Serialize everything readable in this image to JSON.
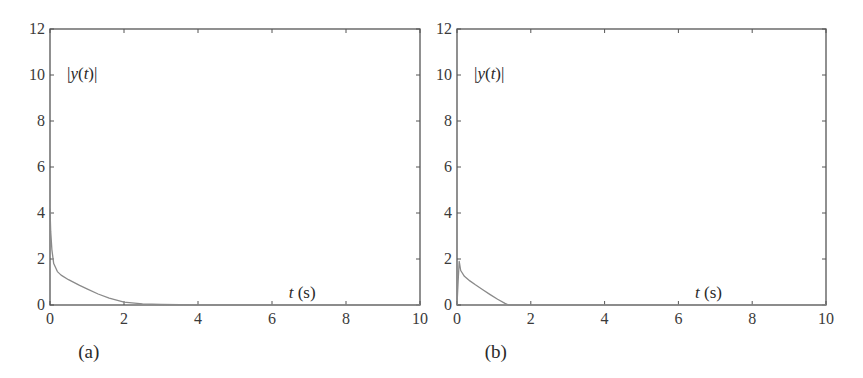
{
  "chart_data": [
    {
      "type": "line",
      "panel": "(a)",
      "caption": "(a)",
      "ylabel_annotation": "|y(t)|",
      "xlabel_annotation": "t (s)",
      "xlim": [
        0,
        10
      ],
      "ylim": [
        0,
        12
      ],
      "xticks": [
        0,
        2,
        4,
        6,
        8,
        10
      ],
      "yticks": [
        0,
        2,
        4,
        6,
        8,
        10,
        12
      ],
      "grid": false,
      "series": [
        {
          "name": "|y(t)|",
          "x": [
            0,
            0.02,
            0.05,
            0.1,
            0.2,
            0.3,
            0.5,
            0.8,
            1.0,
            1.3,
            1.6,
            2.0,
            2.5,
            3.0,
            4.0,
            10.0
          ],
          "y": [
            4.2,
            3.2,
            2.4,
            1.8,
            1.45,
            1.3,
            1.1,
            0.85,
            0.7,
            0.48,
            0.3,
            0.12,
            0.05,
            0.02,
            0.0,
            0.0
          ]
        }
      ]
    },
    {
      "type": "line",
      "panel": "(b)",
      "caption": "(b)",
      "ylabel_annotation": "|y(t)|",
      "xlabel_annotation": "t (s)",
      "xlim": [
        0,
        10
      ],
      "ylim": [
        0,
        12
      ],
      "xticks": [
        0,
        2,
        4,
        6,
        8,
        10
      ],
      "yticks": [
        0,
        2,
        4,
        6,
        8,
        10,
        12
      ],
      "grid": false,
      "series": [
        {
          "name": "|y(t)|",
          "x": [
            0,
            0.03,
            0.06,
            0.1,
            0.2,
            0.35,
            0.5,
            0.7,
            0.9,
            1.1,
            1.3,
            1.4,
            2.0,
            10.0
          ],
          "y": [
            0.0,
            1.0,
            1.9,
            1.5,
            1.25,
            1.05,
            0.88,
            0.66,
            0.45,
            0.25,
            0.07,
            0.0,
            0.0,
            0.0
          ]
        }
      ]
    }
  ],
  "colors": {
    "axis": "#555555",
    "curve": "#8a8a8a",
    "text": "#2a2a2a"
  }
}
